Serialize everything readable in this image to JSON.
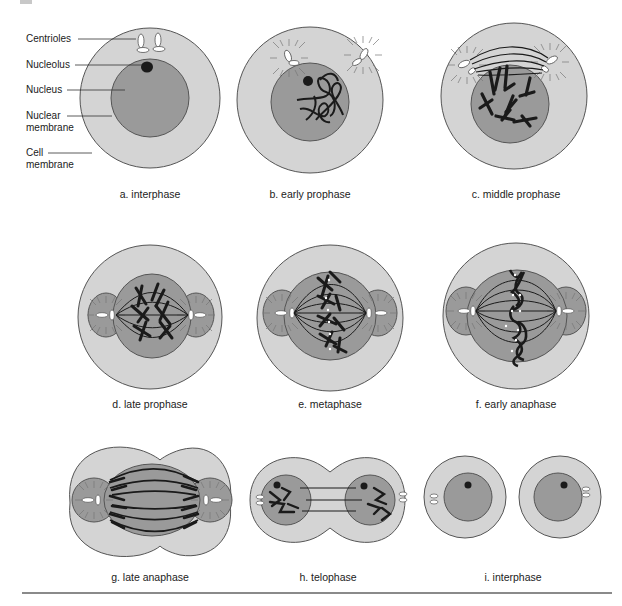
{
  "figure": {
    "colors": {
      "cytoplasm": "#d4d4d4",
      "nucleus": "#9a9a9a",
      "outline": "#555555",
      "chromosome": "#1a1a1a",
      "spindle": "#222222",
      "background": "#ffffff"
    },
    "labels": {
      "centrioles": "Centrioles",
      "nucleolus": "Nucleolus",
      "nucleus": "Nucleus",
      "nuclear_membrane_1": "Nuclear",
      "nuclear_membrane_2": "membrane",
      "cell_membrane_1": "Cell",
      "cell_membrane_2": "membrane"
    },
    "stages": [
      {
        "id": "a",
        "caption": "a. interphase"
      },
      {
        "id": "b",
        "caption": "b. early prophase"
      },
      {
        "id": "c",
        "caption": "c. middle prophase"
      },
      {
        "id": "d",
        "caption": "d. late prophase"
      },
      {
        "id": "e",
        "caption": "e. metaphase"
      },
      {
        "id": "f",
        "caption": "f. early anaphase"
      },
      {
        "id": "g",
        "caption": "g. late anaphase"
      },
      {
        "id": "h",
        "caption": "h. telophase"
      },
      {
        "id": "i",
        "caption": "i. interphase"
      }
    ]
  }
}
